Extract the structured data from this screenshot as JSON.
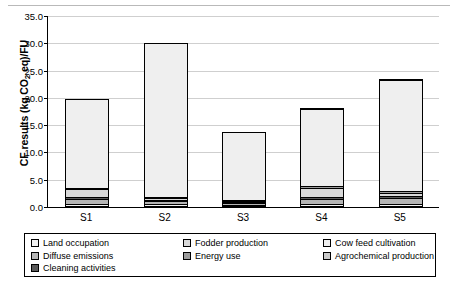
{
  "chart_data": {
    "type": "bar",
    "title": "",
    "subtitle": "",
    "xlabel": "",
    "ylabel": "CF results (kg CO2 eq)/FU",
    "ylabel_main": "CF results (kg CO",
    "ylabel_sub": "2",
    "ylabel_tail": " eq)/FU",
    "categories": [
      "S1",
      "S2",
      "S3",
      "S4",
      "S5"
    ],
    "ylim": [
      0.0,
      35.0
    ],
    "yticks": [
      "0.0",
      "5.0",
      "10.0",
      "15.0",
      "20.0",
      "25.0",
      "30.0",
      "35.0"
    ],
    "ytick_values": [
      0.0,
      5.0,
      10.0,
      15.0,
      20.0,
      25.0,
      30.0,
      35.0
    ],
    "grid": true,
    "stacked": true,
    "legend_position": "bottom",
    "series": [
      {
        "name": "Land occupation",
        "color": "#f2f2f2",
        "values": [
          0.6,
          0.5,
          0.4,
          0.6,
          0.6
        ]
      },
      {
        "name": "Diffuse emissions",
        "color": "#b5b5b5",
        "values": [
          1.1,
          0.7,
          0.5,
          1.1,
          1.2
        ]
      },
      {
        "name": "Cleaning activities",
        "color": "#595959",
        "values": [
          0.5,
          0.4,
          0.3,
          0.5,
          0.5
        ]
      },
      {
        "name": "Fodder production",
        "color": "#d9d9d9",
        "values": [
          1.6,
          0.6,
          0.5,
          1.9,
          0.8
        ]
      },
      {
        "name": "Energy use",
        "color": "#9c9c9c",
        "values": [
          0.5,
          0.4,
          0.3,
          0.5,
          0.5
        ]
      },
      {
        "name": "Cow feed cultivation",
        "color": "#efefef",
        "values": [
          16.4,
          28.3,
          12.6,
          14.2,
          20.6
        ]
      },
      {
        "name": "Agrochemical production",
        "color": "#c9c9c9",
        "values": [
          0.2,
          0.2,
          0.1,
          0.4,
          0.3
        ]
      }
    ],
    "totals": [
      20.9,
      31.1,
      14.7,
      19.2,
      24.5
    ]
  },
  "legend": {
    "items": [
      {
        "label": "Land occupation",
        "color": "#f2f2f2"
      },
      {
        "label": "Fodder production",
        "color": "#d9d9d9"
      },
      {
        "label": "Cow feed cultivation",
        "color": "#efefef"
      },
      {
        "label": "Diffuse emissions",
        "color": "#b5b5b5"
      },
      {
        "label": "Energy use",
        "color": "#9c9c9c"
      },
      {
        "label": "Agrochemical production",
        "color": "#c9c9c9"
      },
      {
        "label": "Cleaning activities",
        "color": "#595959"
      }
    ]
  }
}
